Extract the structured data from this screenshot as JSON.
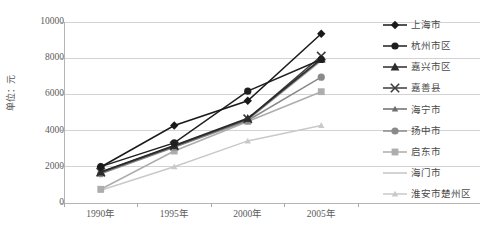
{
  "chart_data": {
    "type": "line",
    "title": "",
    "xlabel": "",
    "ylabel": "单位：元",
    "x": [
      "1990年",
      "1995年",
      "2000年",
      "2005年"
    ],
    "categories": [
      "1990年",
      "1995年",
      "2000年",
      "2005年"
    ],
    "ylim": [
      0,
      10000
    ],
    "ytick_labels": [
      "0",
      "2000",
      "4000",
      "6000",
      "8000",
      "10000"
    ],
    "ytick_values": [
      0,
      2000,
      4000,
      6000,
      8000,
      10000
    ],
    "grid": "horizontal",
    "legend_position": "right",
    "series": [
      {
        "name": "上海市",
        "marker": "diamond",
        "color": "#1a1a1a",
        "values": [
          1990,
          4280,
          5650,
          9350
        ]
      },
      {
        "name": "杭州市区",
        "marker": "circle",
        "color": "#1f1f1f",
        "values": [
          2010,
          3320,
          6180,
          7930
        ]
      },
      {
        "name": "嘉兴市区",
        "marker": "triangle",
        "color": "#2b2b2b",
        "values": [
          1710,
          3180,
          4680,
          7960
        ]
      },
      {
        "name": "嘉善县",
        "marker": "cross",
        "color": "#3d3d3d",
        "values": [
          1700,
          3150,
          4650,
          8120
        ]
      },
      {
        "name": "海宁市",
        "marker": "triangle-small",
        "color": "#6e6e6e",
        "values": [
          1680,
          3130,
          4620,
          7900
        ]
      },
      {
        "name": "扬中市",
        "marker": "circle",
        "color": "#8a8a8a",
        "values": [
          1620,
          3080,
          4560,
          6950
        ]
      },
      {
        "name": "启东市",
        "marker": "square",
        "color": "#adadad",
        "values": [
          760,
          2870,
          4500,
          6150
        ]
      },
      {
        "name": "海门市",
        "marker": "none",
        "color": "#c4c4c4",
        "values": [
          1650,
          3100,
          4590,
          7850
        ]
      },
      {
        "name": "淮安市楚州区",
        "marker": "triangle-small",
        "color": "#c9c9c9",
        "values": [
          700,
          2000,
          3430,
          4280
        ]
      }
    ]
  },
  "axis": {
    "y_title": "单位：元"
  }
}
